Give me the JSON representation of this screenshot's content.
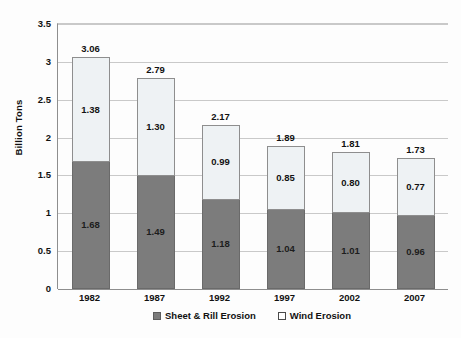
{
  "chart_data": {
    "type": "bar",
    "subtype": "stacked-bar",
    "title": "",
    "xlabel": "",
    "ylabel": "Billion Tons",
    "ylim": [
      0,
      3.5
    ],
    "ytick_values": [
      0,
      0.5,
      1,
      1.5,
      2,
      2.5,
      3,
      3.5
    ],
    "ytick_labels": [
      "0",
      "0.5",
      "1",
      "1.5",
      "2",
      "2.5",
      "3",
      "3.5"
    ],
    "grid": true,
    "legend_position": "bottom",
    "categories": [
      "1982",
      "1987",
      "1992",
      "1997",
      "2002",
      "2007"
    ],
    "series": [
      {
        "name": "Sheet & Rill Erosion",
        "color": "#7c7c7c",
        "values": [
          1.68,
          1.49,
          1.18,
          1.04,
          1.01,
          0.96
        ],
        "labels": [
          "1.68",
          "1.49",
          "1.18",
          "1.04",
          "1.01",
          "0.96"
        ]
      },
      {
        "name": "Wind Erosion",
        "color": "#eef2f4",
        "values": [
          1.38,
          1.3,
          0.99,
          0.85,
          0.8,
          0.77
        ],
        "labels": [
          "1.38",
          "1.30",
          "0.99",
          "0.85",
          "0.80",
          "0.77"
        ]
      }
    ],
    "totals": [
      3.06,
      2.79,
      2.17,
      1.89,
      1.81,
      1.73
    ],
    "total_labels": [
      "3.06",
      "2.79",
      "2.17",
      "1.89",
      "1.81",
      "1.73"
    ]
  },
  "legend": {
    "items": [
      {
        "label": "Sheet & Rill Erosion",
        "swatch": "sheet"
      },
      {
        "label": "Wind Erosion",
        "swatch": "wind"
      }
    ]
  }
}
